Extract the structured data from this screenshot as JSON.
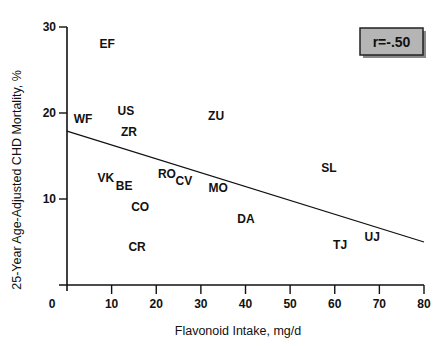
{
  "chart_data": {
    "type": "scatter",
    "title": "",
    "xlabel": "Flavonoid Intake, mg/d",
    "ylabel": "25-Year Age-Adjusted CHD Mortality, %",
    "xlim": [
      0,
      80
    ],
    "ylim": [
      0,
      30
    ],
    "x_ticks": [
      0,
      10,
      20,
      30,
      40,
      50,
      60,
      70,
      80
    ],
    "y_ticks": [
      10,
      20,
      30
    ],
    "grid": false,
    "legend": null,
    "annotation": "r=-.50",
    "points": [
      {
        "label": "EF",
        "x": 9.0,
        "y": 28.0
      },
      {
        "label": "WF",
        "x": 3.6,
        "y": 19.3
      },
      {
        "label": "US",
        "x": 13.2,
        "y": 20.2
      },
      {
        "label": "ZR",
        "x": 13.9,
        "y": 17.8
      },
      {
        "label": "ZU",
        "x": 33.4,
        "y": 19.7
      },
      {
        "label": "VK",
        "x": 8.7,
        "y": 12.4
      },
      {
        "label": "BE",
        "x": 12.8,
        "y": 11.5
      },
      {
        "label": "CO",
        "x": 16.4,
        "y": 9.1
      },
      {
        "label": "CR",
        "x": 15.7,
        "y": 4.4
      },
      {
        "label": "RO",
        "x": 22.4,
        "y": 12.9
      },
      {
        "label": "CV",
        "x": 26.2,
        "y": 12.1
      },
      {
        "label": "MO",
        "x": 33.9,
        "y": 11.3
      },
      {
        "label": "DA",
        "x": 40.1,
        "y": 7.7
      },
      {
        "label": "SL",
        "x": 58.7,
        "y": 13.6
      },
      {
        "label": "TJ",
        "x": 61.2,
        "y": 4.7
      },
      {
        "label": "UJ",
        "x": 68.4,
        "y": 5.6
      }
    ],
    "regression_line": {
      "x": [
        0,
        80
      ],
      "y": [
        17.9,
        5.0
      ]
    }
  },
  "labels": {
    "xlabel": "Flavonoid Intake, mg/d",
    "ylabel": "25-Year Age-Adjusted CHD Mortality, %",
    "annotation": "r=-.50",
    "x_tick_labels": [
      "0",
      "10",
      "20",
      "30",
      "40",
      "50",
      "60",
      "70",
      "80"
    ],
    "y_tick_labels": [
      "10",
      "20",
      "30"
    ]
  },
  "colors": {
    "axis": "#111111",
    "annotation_fill": "#b5b5b5",
    "background": "#ffffff"
  }
}
